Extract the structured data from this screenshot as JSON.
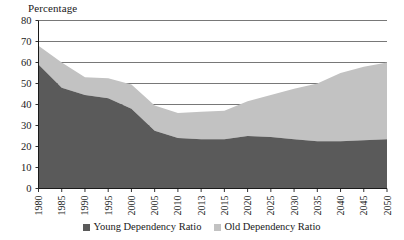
{
  "chart_data": {
    "type": "area",
    "stacked": true,
    "title": "",
    "subtitle": "",
    "xlabel": "",
    "ylabel": "Percentage",
    "ylim": [
      0,
      80
    ],
    "ytick_step": 10,
    "yticks": [
      "0",
      "10",
      "20",
      "30",
      "40",
      "50",
      "60",
      "70",
      "80"
    ],
    "grid": "horizontal",
    "legend_position": "bottom-center",
    "categories": [
      "1980",
      "1985",
      "1990",
      "1995",
      "2000",
      "2005",
      "2010",
      "2013",
      "2015",
      "2020",
      "2025",
      "2030",
      "2035",
      "2040",
      "2045",
      "2050"
    ],
    "series": [
      {
        "name": "Young Dependency Ratio",
        "color": "#5a5a5a",
        "values": [
          59.0,
          48.0,
          44.5,
          43.0,
          38.0,
          27.5,
          24.0,
          23.5,
          23.5,
          25.0,
          24.5,
          23.5,
          22.5,
          22.5,
          23.0,
          23.5
        ]
      },
      {
        "name": "Old Dependency Ratio",
        "color": "#c2c2c2",
        "values": [
          9.0,
          12.0,
          8.5,
          9.5,
          11.5,
          12.0,
          12.0,
          13.0,
          13.5,
          16.5,
          20.0,
          24.0,
          27.5,
          32.5,
          35.0,
          36.5
        ]
      }
    ],
    "totals": [
      68.0,
      60.0,
      53.0,
      52.5,
      49.5,
      39.5,
      36.0,
      36.5,
      37.0,
      41.5,
      44.5,
      47.5,
      50.0,
      55.0,
      58.0,
      60.0
    ],
    "colors": {
      "young": "#5a5a5a",
      "old": "#c2c2c2",
      "axis": "#1a1a1a",
      "grid": "#555555",
      "background": "#ffffff"
    }
  },
  "legend": {
    "items": [
      {
        "label": "Young Dependency Ratio"
      },
      {
        "label": "Old Dependency Ratio"
      }
    ]
  }
}
